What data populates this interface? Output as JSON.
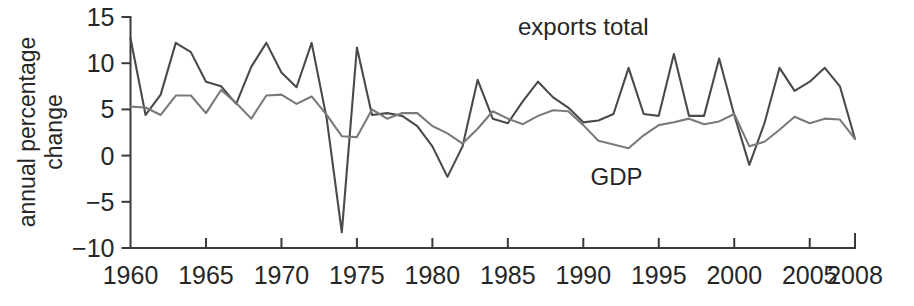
{
  "chart_data": {
    "type": "line",
    "title": "",
    "xlabel": "",
    "ylabel": "annual percentage change",
    "xlim": [
      1960,
      2008
    ],
    "ylim": [
      -10,
      15
    ],
    "grid": false,
    "legend_position": "inline-annotation",
    "x_ticks": [
      1960,
      1965,
      1970,
      1975,
      1980,
      1985,
      1990,
      1995,
      2000,
      2005,
      2008
    ],
    "x_tick_labels": [
      "1960",
      "1965",
      "1970",
      "1975",
      "1980",
      "1985",
      "1990",
      "1995",
      "2000",
      "2005",
      "2008"
    ],
    "y_ticks": [
      -10,
      -5,
      0,
      5,
      10,
      15
    ],
    "y_tick_labels": [
      "−10",
      "−5",
      "0",
      "5",
      "10",
      "15"
    ],
    "x": [
      1960,
      1961,
      1962,
      1963,
      1964,
      1965,
      1966,
      1967,
      1968,
      1969,
      1970,
      1971,
      1972,
      1973,
      1974,
      1975,
      1976,
      1977,
      1978,
      1979,
      1980,
      1981,
      1982,
      1983,
      1984,
      1985,
      1986,
      1987,
      1988,
      1989,
      1990,
      1991,
      1992,
      1993,
      1994,
      1995,
      1996,
      1997,
      1998,
      1999,
      2000,
      2001,
      2002,
      2003,
      2004,
      2005,
      2006,
      2007,
      2008
    ],
    "series": [
      {
        "name": "exports total",
        "color": "#4a4a4a",
        "annotation": "exports total",
        "values": [
          12.7,
          4.4,
          6.6,
          12.2,
          11.2,
          8.0,
          7.5,
          5.6,
          9.6,
          12.2,
          9.0,
          7.4,
          12.2,
          4.0,
          -8.3,
          11.7,
          4.4,
          4.6,
          4.3,
          3.2,
          1.0,
          -2.3,
          1.0,
          8.2,
          4.0,
          3.5,
          5.9,
          8.0,
          6.3,
          5.2,
          3.6,
          3.8,
          4.5,
          9.5,
          4.5,
          4.3,
          11.0,
          4.3,
          4.3,
          10.5,
          4.4,
          -1.0,
          3.5,
          9.5,
          7.0,
          8.0,
          9.5,
          7.5,
          1.8
        ]
      },
      {
        "name": "GDP",
        "color": "#7a7a7a",
        "annotation": "GDP",
        "values": [
          5.3,
          5.2,
          4.4,
          6.5,
          6.5,
          4.6,
          7.1,
          5.7,
          4.0,
          6.5,
          6.6,
          5.6,
          6.4,
          4.4,
          2.1,
          2.0,
          5.0,
          4.0,
          4.6,
          4.6,
          3.2,
          2.4,
          1.3,
          2.9,
          4.8,
          4.0,
          3.4,
          4.3,
          4.9,
          4.8,
          3.3,
          1.6,
          1.2,
          0.8,
          2.2,
          3.3,
          3.6,
          4.0,
          3.4,
          3.7,
          4.5,
          1.0,
          1.5,
          2.8,
          4.2,
          3.5,
          4.0,
          3.9,
          1.8
        ]
      }
    ],
    "annotations": [
      {
        "text": "exports total",
        "x": 1990.0,
        "y": 13.0
      },
      {
        "text": "GDP",
        "x": 1992.2,
        "y": -3.2
      }
    ]
  },
  "axis": {
    "y_title_line1": "annual percentage",
    "y_title_line2": "change"
  }
}
